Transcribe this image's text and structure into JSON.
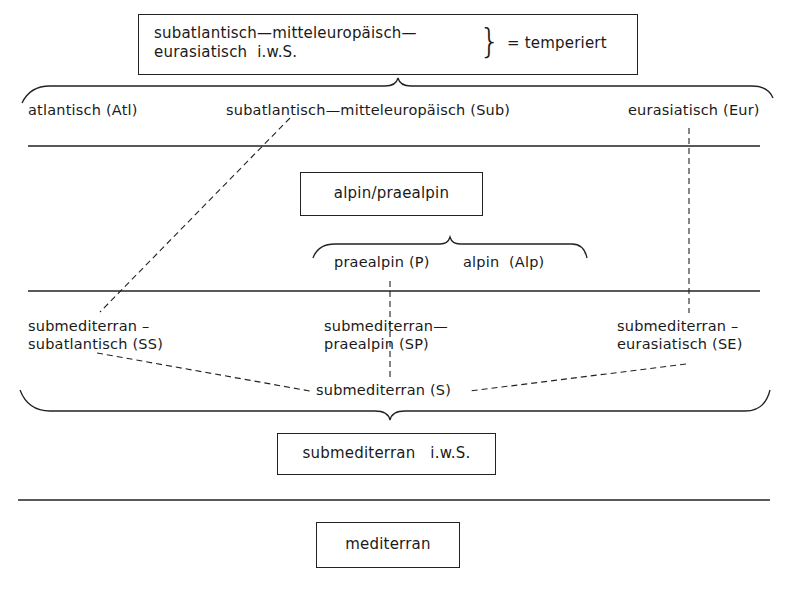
{
  "top_box": {
    "line1": "subatlantisch—mitteleuropäisch—",
    "line2": "eurasiatisch  i.w.S.",
    "brace": "}",
    "equals": "= temperiert"
  },
  "temperate_row": {
    "atlantic": "atlantisch (Atl)",
    "subatlantic": "subatlantisch—mitteleuropäisch (Sub)",
    "eurasian": "eurasiatisch (Eur)"
  },
  "alpine_box": {
    "label": "alpin/praealpin"
  },
  "alpine_row": {
    "praealpine": "praealpin (P)",
    "alpine": "alpin  (Alp)"
  },
  "submed_row": {
    "ss_line1": "submediterran –",
    "ss_line2": "subatlantisch (SS)",
    "sp_line1": "submediterran—",
    "sp_line2": "praealpin (SP)",
    "se_line1": "submediterran –",
    "se_line2": "eurasiatisch (SE)",
    "s": "submediterran (S)"
  },
  "submed_box": {
    "label": "submediterran   i.w.S."
  },
  "med_box": {
    "label": "mediterran"
  },
  "colors": {
    "ink": "#1a1a1a",
    "paper": "#ffffff"
  }
}
